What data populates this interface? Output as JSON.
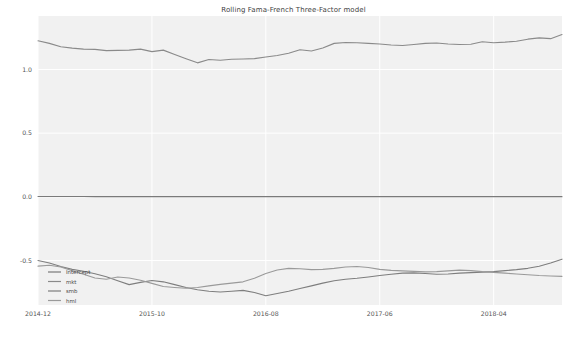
{
  "chart_data": {
    "type": "line",
    "title": "Rolling Fama-French Three-Factor model",
    "xlabel": "",
    "ylabel": "",
    "xlim": [
      0,
      46
    ],
    "ylim": [
      -0.85,
      1.42
    ],
    "yticks": [
      1.0,
      0.5,
      0.0,
      -0.5
    ],
    "ytick_labels": [
      "1.0",
      "0.5",
      "0.0",
      "-0.5"
    ],
    "xticks": [
      0,
      10,
      20,
      30,
      40
    ],
    "xtick_labels": [
      "2014-12",
      "2015-10",
      "2016-08",
      "2017-06",
      "2018-04"
    ],
    "grid": true,
    "grid_color": "#ffffff",
    "plot_bgcolor": "#f1f1f1",
    "legend_position": "lower left",
    "x": [
      0,
      1,
      2,
      3,
      4,
      5,
      6,
      7,
      8,
      9,
      10,
      11,
      12,
      13,
      14,
      15,
      16,
      17,
      18,
      19,
      20,
      21,
      22,
      23,
      24,
      25,
      26,
      27,
      28,
      29,
      30,
      31,
      32,
      33,
      34,
      35,
      36,
      37,
      38,
      39,
      40,
      41,
      42,
      43,
      44,
      45,
      46
    ],
    "series": [
      {
        "name": "Intercept",
        "color": "#7a7a7a",
        "values": [
          0.002,
          0.002,
          0.002,
          0.002,
          0.002,
          0.001,
          0.001,
          0.001,
          0.001,
          0.001,
          0.001,
          0.001,
          0.001,
          0.001,
          0.001,
          0.001,
          0.001,
          0.001,
          0.001,
          0.001,
          0.001,
          0.001,
          0.001,
          0.001,
          0.001,
          0.001,
          0.001,
          0.001,
          0.001,
          0.001,
          0.001,
          0.001,
          0.001,
          0.001,
          0.001,
          0.001,
          0.001,
          0.001,
          0.001,
          0.001,
          0.001,
          0.001,
          0.001,
          0.001,
          0.001,
          0.001,
          0.001
        ]
      },
      {
        "name": "mkt",
        "color": "#8a8a8a",
        "values": [
          1.225,
          1.205,
          1.178,
          1.168,
          1.16,
          1.158,
          1.148,
          1.15,
          1.152,
          1.16,
          1.14,
          1.152,
          1.118,
          1.085,
          1.052,
          1.078,
          1.072,
          1.08,
          1.082,
          1.085,
          1.098,
          1.11,
          1.128,
          1.155,
          1.145,
          1.168,
          1.205,
          1.212,
          1.21,
          1.205,
          1.2,
          1.192,
          1.188,
          1.196,
          1.205,
          1.208,
          1.2,
          1.196,
          1.198,
          1.218,
          1.21,
          1.215,
          1.222,
          1.238,
          1.248,
          1.242,
          1.275
        ]
      },
      {
        "name": "smb",
        "color": "#7e7e7e",
        "values": [
          -0.5,
          -0.52,
          -0.548,
          -0.57,
          -0.585,
          -0.605,
          -0.628,
          -0.66,
          -0.69,
          -0.672,
          -0.658,
          -0.668,
          -0.69,
          -0.712,
          -0.73,
          -0.742,
          -0.748,
          -0.742,
          -0.735,
          -0.752,
          -0.778,
          -0.76,
          -0.742,
          -0.72,
          -0.7,
          -0.678,
          -0.66,
          -0.648,
          -0.64,
          -0.63,
          -0.618,
          -0.608,
          -0.6,
          -0.598,
          -0.602,
          -0.608,
          -0.606,
          -0.6,
          -0.596,
          -0.592,
          -0.588,
          -0.58,
          -0.572,
          -0.562,
          -0.545,
          -0.52,
          -0.49
        ]
      },
      {
        "name": "hml",
        "color": "#9a9a9a",
        "values": [
          -0.545,
          -0.538,
          -0.552,
          -0.58,
          -0.608,
          -0.638,
          -0.648,
          -0.63,
          -0.638,
          -0.655,
          -0.68,
          -0.705,
          -0.712,
          -0.718,
          -0.712,
          -0.7,
          -0.688,
          -0.678,
          -0.668,
          -0.64,
          -0.602,
          -0.575,
          -0.562,
          -0.565,
          -0.572,
          -0.57,
          -0.562,
          -0.552,
          -0.548,
          -0.555,
          -0.57,
          -0.578,
          -0.582,
          -0.586,
          -0.59,
          -0.588,
          -0.582,
          -0.576,
          -0.58,
          -0.588,
          -0.594,
          -0.6,
          -0.606,
          -0.612,
          -0.618,
          -0.622,
          -0.625
        ]
      }
    ]
  }
}
